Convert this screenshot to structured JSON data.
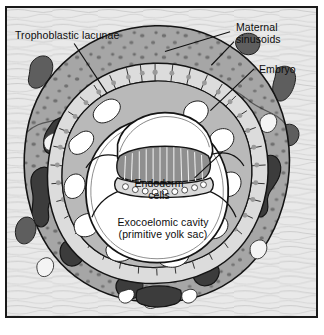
{
  "figure": {
    "frame_color": "#1a1a1a",
    "background_color": "#e9e9e9"
  },
  "labels": {
    "trophoblastic_lacunae": "Trophoblastic lacunae",
    "maternal_sinusoids_line1": "Maternal",
    "maternal_sinusoids_line2": "sinusoids",
    "embryo": "Embryo",
    "endoderm_line1": "Endoderm",
    "endoderm_line2": "cells",
    "exocoelomic_line1": "Exocoelomic cavity",
    "exocoelomic_line2": "(primitive yolk sac)"
  },
  "structures": [
    {
      "name": "endometrium",
      "label": "Endometrial stroma",
      "color": "#e9e9e9"
    },
    {
      "name": "maternal-sinusoid",
      "label": "Maternal sinusoids",
      "color": "#5e5e5e"
    },
    {
      "name": "syncytiotrophoblast",
      "label": "Syncytiotrophoblast",
      "color": "#a6a6a6"
    },
    {
      "name": "trophoblastic-lacuna",
      "label": "Trophoblastic lacunae",
      "color": "#3c3c3c"
    },
    {
      "name": "cytotrophoblast",
      "label": "Cytotrophoblast cells",
      "color": "#dcdcdc"
    },
    {
      "name": "extraembryonic-mesoderm",
      "label": "Extraembryonic mesoderm",
      "color": "#b5b5b5"
    },
    {
      "name": "amniotic-cavity",
      "label": "Amniotic cavity",
      "color": "#ffffff"
    },
    {
      "name": "epiblast",
      "label": "Epiblast (columnar cells)",
      "color": "#8f8f8f"
    },
    {
      "name": "endoderm",
      "label": "Endoderm cells",
      "color": "#d2d2d2"
    },
    {
      "name": "exocoelomic-cavity",
      "label": "Exocoelomic cavity (primitive yolk sac)",
      "color": "#ffffff"
    }
  ],
  "colors": {
    "ink": "#0d0d0d",
    "outline": "#141414",
    "endometrium": "#e9e9e9",
    "endometrium_fiber": "#bdbdbd",
    "sinusoid": "#5e5e5e",
    "syncytio": "#a6a6a6",
    "syncytio_nucleus": "#6e6e6e",
    "lacuna": "#3c3c3c",
    "cyto_cell": "#dcdcdc",
    "cyto_nucleus": "#9a9a9a",
    "mesoderm": "#b5b5b5",
    "cavity": "#ffffff",
    "epiblast": "#8f8f8f"
  }
}
